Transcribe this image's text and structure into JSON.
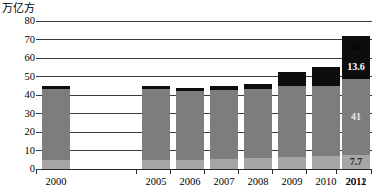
{
  "chart_data": {
    "type": "bar",
    "subtype": "stacked-bar",
    "title": "",
    "xlabel": "",
    "ylabel": "万亿方",
    "ylim": [
      0,
      80
    ],
    "yticks": [
      0,
      10,
      20,
      30,
      40,
      50,
      60,
      70,
      80
    ],
    "grid": true,
    "legend": null,
    "categories": [
      "2000",
      "2005",
      "2006",
      "2007",
      "2008",
      "2009",
      "2010",
      "2011",
      "2012"
    ],
    "series": [
      {
        "name": "light-gray-segment",
        "color": "#a6a6a6",
        "values": [
          5.0,
          5.0,
          5.0,
          5.2,
          6.0,
          6.5,
          7.0,
          7.0,
          7.7
        ]
      },
      {
        "name": "mid-gray-segment",
        "color": "#7d7d7d",
        "values": [
          38.5,
          38.0,
          37.0,
          37.3,
          37.0,
          38.5,
          38.0,
          41.6,
          41.0
        ]
      },
      {
        "name": "black-segment",
        "color": "#0d0d0d",
        "values": [
          1.5,
          2.0,
          2.0,
          2.5,
          3.0,
          7.5,
          10.0,
          23.4,
          13.6
        ]
      }
    ],
    "totals": [
      45.0,
      45.0,
      44.0,
      45.0,
      46.0,
      52.5,
      55.0,
      72.0,
      62.3
    ],
    "annotations": [
      {
        "category": "2011",
        "segment": "black-segment",
        "text": "23.4",
        "placement": "inside"
      },
      {
        "category": "2012",
        "segment": "total",
        "text": "62",
        "placement": "above"
      },
      {
        "category": "2012",
        "segment": "black-segment",
        "text": "13.6",
        "placement": "inside"
      },
      {
        "category": "2012",
        "segment": "mid-gray-segment",
        "text": "41",
        "placement": "inside"
      },
      {
        "category": "2012",
        "segment": "light-gray-segment",
        "text": "7.7",
        "placement": "inside"
      }
    ]
  },
  "axis": {
    "unit_label": "万亿方",
    "y_ticks": [
      "80",
      "70",
      "60",
      "50",
      "40",
      "30",
      "20",
      "10",
      "0"
    ],
    "x_labels": [
      "2000",
      "2005",
      "2006",
      "2007",
      "2008",
      "2009",
      "2010",
      "2011",
      "2012"
    ]
  },
  "colors": {
    "light_gray": "#a6a6a6",
    "mid_gray": "#7d7d7d",
    "black": "#0d0d0d",
    "gridline": "#3a3a3a",
    "background": "#ffffff"
  }
}
